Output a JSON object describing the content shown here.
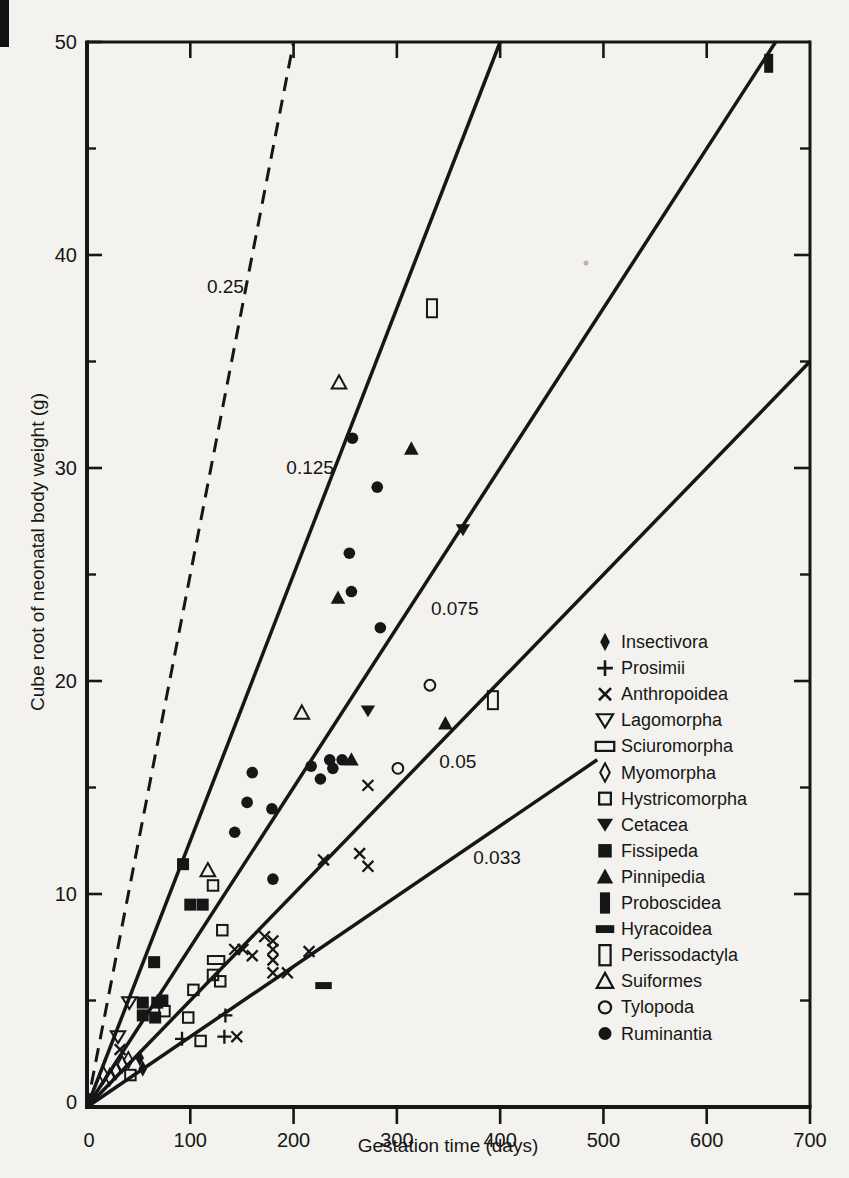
{
  "figure": {
    "type_note": "scanned scatter plot of neonatal weight vs gestation time in mammals"
  },
  "chart_data": {
    "type": "scatter",
    "title": "",
    "xlabel": "Gestation time (days)",
    "ylabel": "Cube root of neonatal body weight (g)",
    "xlim": [
      0,
      700
    ],
    "ylim": [
      0,
      50
    ],
    "x_tick_labels": [
      "0",
      "100",
      "200",
      "300",
      "400",
      "500",
      "600",
      "700"
    ],
    "x_tick_values": [
      0,
      100,
      200,
      300,
      400,
      500,
      600,
      700
    ],
    "y_tick_labels": [
      "0",
      "10",
      "20",
      "30",
      "40",
      "50"
    ],
    "y_tick_values": [
      0,
      10,
      20,
      30,
      40,
      50
    ],
    "y_minor_tick_values": [
      5,
      15,
      25,
      35,
      45
    ],
    "grid": false,
    "legend_position": "right-middle",
    "reference_lines": [
      {
        "label": "0.25",
        "slope": 0.25,
        "x_start": 0,
        "x_end": 200,
        "style": "dashed",
        "label_pos": [
          134,
          38.5
        ]
      },
      {
        "label": "0.125",
        "slope": 0.125,
        "x_start": 0,
        "x_end": 400,
        "style": "solid",
        "label_pos": [
          216,
          30.0
        ]
      },
      {
        "label": "0.075",
        "slope": 0.075,
        "x_start": 0,
        "x_end": 667,
        "style": "solid",
        "label_pos": [
          356,
          23.4
        ]
      },
      {
        "label": "0.05",
        "slope": 0.05,
        "x_start": 0,
        "x_end": 700,
        "style": "solid",
        "label_pos": [
          359,
          16.2
        ]
      },
      {
        "label": "0.033",
        "slope": 0.033,
        "x_start": 0,
        "x_end": 494,
        "style": "solid",
        "label_pos": [
          397,
          11.7
        ]
      }
    ],
    "series": [
      {
        "name": "Insectivora",
        "marker": "diamond-filled",
        "points": [
          [
            51,
            2.3
          ],
          [
            54,
            1.8
          ]
        ]
      },
      {
        "name": "Prosimii",
        "marker": "plus",
        "points": [
          [
            92,
            3.2
          ],
          [
            133,
            3.3
          ],
          [
            134,
            4.3
          ]
        ]
      },
      {
        "name": "Anthropoidea",
        "marker": "cross",
        "points": [
          [
            32,
            2.7
          ],
          [
            145,
            3.3
          ],
          [
            143,
            7.4
          ],
          [
            151,
            7.4
          ],
          [
            160,
            7.1
          ],
          [
            172,
            8.0
          ],
          [
            180,
            7.8
          ],
          [
            180,
            7.4
          ],
          [
            180,
            6.9
          ],
          [
            180,
            6.3
          ],
          [
            194,
            6.3
          ],
          [
            215,
            7.3
          ],
          [
            229,
            11.6
          ],
          [
            264,
            11.9
          ],
          [
            272,
            11.3
          ],
          [
            272,
            15.1
          ]
        ]
      },
      {
        "name": "Lagomorpha",
        "marker": "triangle-down-open",
        "points": [
          [
            30,
            3.3
          ],
          [
            41,
            4.9
          ]
        ]
      },
      {
        "name": "Sciuromorpha",
        "marker": "rect-wide-open",
        "points": [
          [
            125,
            6.9
          ]
        ]
      },
      {
        "name": "Myomorpha",
        "marker": "diamond-open",
        "points": [
          [
            16,
            1.5
          ],
          [
            22,
            1.4
          ],
          [
            28,
            1.7
          ],
          [
            34,
            2.0
          ],
          [
            40,
            2.2
          ]
        ]
      },
      {
        "name": "Hystricomorpha",
        "marker": "square-open",
        "points": [
          [
            42,
            1.5
          ],
          [
            75,
            4.5
          ],
          [
            98,
            4.2
          ],
          [
            103,
            5.5
          ],
          [
            110,
            3.1
          ],
          [
            122,
            6.2
          ],
          [
            129,
            5.9
          ],
          [
            122,
            10.4
          ],
          [
            131,
            8.3
          ]
        ]
      },
      {
        "name": "Cetacea",
        "marker": "triangle-down-filled",
        "points": [
          [
            272,
            18.6
          ],
          [
            364,
            27.1
          ]
        ]
      },
      {
        "name": "Fissipeda",
        "marker": "square-filled",
        "points": [
          [
            54,
            4.9
          ],
          [
            54,
            4.3
          ],
          [
            66,
            4.2
          ],
          [
            68,
            4.9
          ],
          [
            73,
            5.0
          ],
          [
            65,
            6.8
          ],
          [
            93,
            11.4
          ],
          [
            100,
            9.5
          ],
          [
            112,
            9.5
          ]
        ]
      },
      {
        "name": "Pinnipedia",
        "marker": "triangle-up-filled",
        "points": [
          [
            243,
            23.9
          ],
          [
            256,
            16.3
          ],
          [
            314,
            30.9
          ],
          [
            347,
            18.0
          ]
        ]
      },
      {
        "name": "Proboscidea",
        "marker": "rect-tall-filled",
        "points": [
          [
            660,
            49.0
          ]
        ]
      },
      {
        "name": "Hyracoidea",
        "marker": "rect-wide-filled",
        "points": [
          [
            229,
            5.7
          ]
        ]
      },
      {
        "name": "Perissodactyla",
        "marker": "rect-tall-open",
        "points": [
          [
            334,
            37.5
          ],
          [
            393,
            19.1
          ]
        ]
      },
      {
        "name": "Suiformes",
        "marker": "triangle-up-open",
        "points": [
          [
            117,
            11.1
          ],
          [
            208,
            18.5
          ],
          [
            244,
            34.0
          ]
        ]
      },
      {
        "name": "Tylopoda",
        "marker": "circle-open",
        "points": [
          [
            301,
            15.9
          ],
          [
            332,
            19.8
          ]
        ]
      },
      {
        "name": "Ruminantia",
        "marker": "circle-filled",
        "points": [
          [
            143,
            12.9
          ],
          [
            155,
            14.3
          ],
          [
            160,
            15.7
          ],
          [
            179,
            14.0
          ],
          [
            180,
            10.7
          ],
          [
            217,
            16.0
          ],
          [
            226,
            15.4
          ],
          [
            235,
            16.3
          ],
          [
            238,
            15.9
          ],
          [
            247,
            16.3
          ],
          [
            254,
            26.0
          ],
          [
            256,
            24.2
          ],
          [
            257,
            31.4
          ],
          [
            281,
            29.1
          ],
          [
            284,
            22.5
          ]
        ]
      }
    ],
    "colors": {
      "ink": "#161616",
      "paper": "#f4f2ee"
    }
  }
}
